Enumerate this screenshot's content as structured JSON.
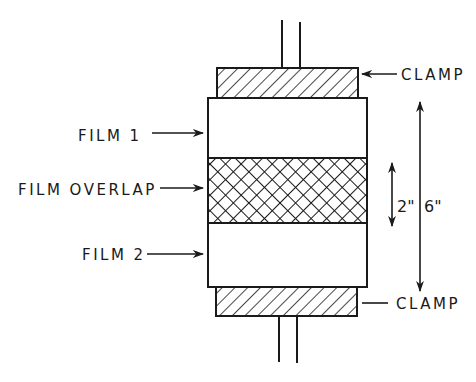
{
  "diagram": {
    "type": "film lap-shear test specimen schematic",
    "labels": {
      "clamp_top": "CLAMP",
      "clamp_bottom": "CLAMP",
      "film1": "FILM 1",
      "overlap": "FILM OVERLAP",
      "film2": "FILM 2"
    },
    "dimensions": {
      "overlap_length": "2\"",
      "total_length": "6\""
    },
    "components": [
      {
        "id": "top-rods",
        "description": "pull rods above top clamp"
      },
      {
        "id": "top-clamp",
        "fill": "diagonal hatch"
      },
      {
        "id": "film-1",
        "fill": "blank"
      },
      {
        "id": "film-overlap",
        "fill": "crosshatch"
      },
      {
        "id": "film-2",
        "fill": "blank"
      },
      {
        "id": "bottom-clamp",
        "fill": "diagonal hatch"
      },
      {
        "id": "bottom-rods",
        "description": "pull rods below bottom clamp"
      }
    ],
    "colors": {
      "ink": "#1a1a1a",
      "paper": "#ffffff"
    }
  }
}
